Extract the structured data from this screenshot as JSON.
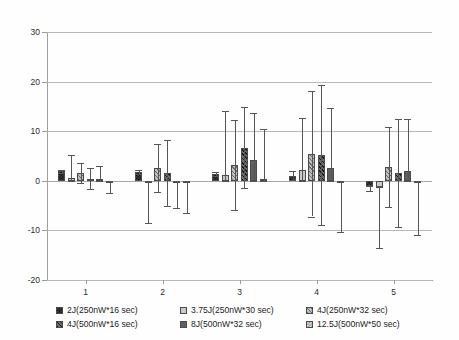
{
  "chart_data": {
    "type": "bar",
    "title": "",
    "subtitle": "",
    "xlabel": "",
    "ylabel": "",
    "grid": true,
    "legend_position": "bottom",
    "categories": [
      "1",
      "2",
      "3",
      "4",
      "5"
    ],
    "ylim": [
      -20,
      30
    ],
    "yticks": [
      30,
      20,
      10,
      0,
      -10,
      -20
    ],
    "xticks": [
      "1",
      "2",
      "3",
      "4",
      "5"
    ],
    "error_bars": true,
    "series": [
      {
        "name": "2J(250nW*16 sec)",
        "pattern": "dark-checkered",
        "color": "#3a3a3a",
        "values": [
          1.9,
          1.8,
          1.4,
          1.0,
          -1.1
        ],
        "err_upper": [
          0.3,
          0.4,
          0.4,
          0.9,
          0.0
        ],
        "err_lower": [
          0.3,
          0.4,
          0.4,
          0.9,
          0.9
        ]
      },
      {
        "name": "3.75J(250nW*30 sec)",
        "pattern": "light-solid",
        "color": "#c9c9c9",
        "values": [
          0.6,
          -0.5,
          1.2,
          2.1,
          -1.5
        ],
        "err_upper": [
          4.6,
          0.5,
          12.9,
          10.6,
          0.5
        ],
        "err_lower": [
          0.6,
          8.0,
          1.2,
          2.1,
          12.0
        ]
      },
      {
        "name": "4J(250nW*32 sec)",
        "pattern": "gray-hatch",
        "color": "#bdbdbd",
        "values": [
          1.5,
          2.6,
          3.2,
          5.5,
          2.8
        ],
        "err_upper": [
          2.0,
          4.8,
          9.0,
          12.7,
          8.0
        ]
      },
      {
        "name": "4J(500nW*16 sec)",
        "pattern": "dark-hatch",
        "color": "#6b6b6b",
        "values": [
          0.4,
          1.6,
          6.7,
          5.2,
          1.6
        ],
        "err_upper": [
          2.1,
          6.6,
          8.1,
          14.2,
          10.9
        ]
      },
      {
        "name": "8J(500nW*32 sec)",
        "pattern": "medium-solid",
        "color": "#5f5f5f",
        "values": [
          0.3,
          -0.2,
          4.2,
          2.5,
          1.9
        ],
        "err_upper": [
          2.7,
          0.2,
          9.5,
          12.2,
          10.6
        ],
        "err_lower": [
          0.3,
          5.3,
          4.2,
          2.5,
          1.9
        ]
      },
      {
        "name": "12.5J(500nW*50 sec)",
        "pattern": "light-checkered",
        "color": "#d2d2d2",
        "values": [
          -0.1,
          -0.3,
          0.4,
          -0.4,
          -0.5
        ],
        "err_upper": [
          0.1,
          0.3,
          10.1,
          0.4,
          0.5
        ],
        "err_lower": [
          2.4,
          6.1,
          0.4,
          9.9,
          10.5
        ]
      }
    ]
  },
  "axis": {
    "y_tick_labels": [
      "30",
      "20",
      "10",
      "0",
      "-10",
      "-20"
    ],
    "x_tick_labels": [
      "1",
      "2",
      "3",
      "4",
      "5"
    ]
  },
  "legend": {
    "items": [
      {
        "label": "2J(250nW*16 sec)",
        "swatch": "series-0-swatch-icon"
      },
      {
        "label": "3.75J(250nW*30 sec)",
        "swatch": "series-1-swatch-icon"
      },
      {
        "label": "4J(250nW*32 sec)",
        "swatch": "series-2-swatch-icon"
      },
      {
        "label": "4J(500nW*16 sec)",
        "swatch": "series-3-swatch-icon"
      },
      {
        "label": "8J(500nW*32 sec)",
        "swatch": "series-4-swatch-icon"
      },
      {
        "label": "12.5J(500nW*50 sec)",
        "swatch": "series-5-swatch-icon"
      }
    ]
  }
}
